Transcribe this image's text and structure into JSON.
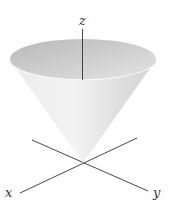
{
  "diagram": {
    "axes": {
      "x_label": "x",
      "y_label": "y",
      "z_label": "z"
    },
    "colors": {
      "axis": "#333333",
      "cone_light": "#f2f2f2",
      "cone_dark": "#c8c8c8",
      "rim": "#bdbdbd"
    }
  }
}
